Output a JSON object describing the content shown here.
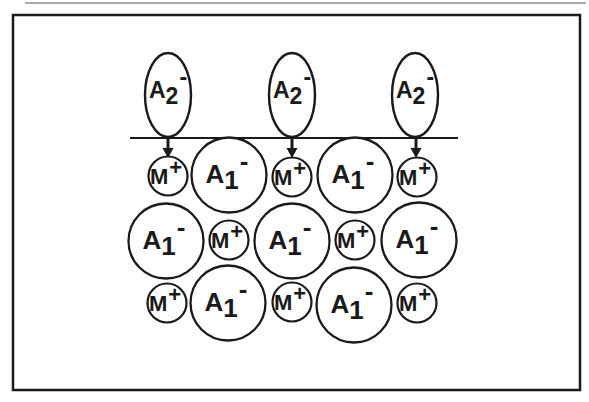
{
  "figure": {
    "canvas": {
      "width": 589,
      "height": 402
    },
    "colors": {
      "background": "#ffffff",
      "ink": "#1a1a1a",
      "faint_rule": "#a8a8a8"
    },
    "page_edge_rule": {
      "x1": 25,
      "x2": 586,
      "y": 3,
      "stroke_width": 1.8
    },
    "frame": {
      "x": 13,
      "y": 15,
      "width": 567,
      "height": 375,
      "stroke_width": 2.5
    },
    "surface_line": {
      "x1": 130,
      "x2": 458,
      "y": 138,
      "stroke_width": 2.2
    },
    "ion_labels": {
      "incoming_anion": {
        "base": "A",
        "sub": "2",
        "sup": "-"
      },
      "lattice_anion": {
        "base": "A",
        "sub": "1",
        "sup": "-"
      },
      "cation": {
        "base": "M",
        "sup": "+"
      }
    },
    "incoming_anions": {
      "rx": 23,
      "ry": 42,
      "stroke_width": 2.4,
      "positions": [
        {
          "cx": 168,
          "cy": 95
        },
        {
          "cx": 292,
          "cy": 95
        },
        {
          "cx": 415,
          "cy": 95
        }
      ]
    },
    "exchange_arrows": {
      "stem_top": 139,
      "head_top": 148,
      "tip": 158,
      "stem_width": 3,
      "half_width": 5.5,
      "xs": [
        168,
        292,
        416
      ]
    },
    "cations": {
      "r": 19.5,
      "stroke_width": 2.2,
      "positions": [
        {
          "cx": 168,
          "cy": 176
        },
        {
          "cx": 292,
          "cy": 177
        },
        {
          "cx": 417,
          "cy": 177
        },
        {
          "cx": 229,
          "cy": 240
        },
        {
          "cx": 355,
          "cy": 240
        },
        {
          "cx": 167,
          "cy": 303
        },
        {
          "cx": 292,
          "cy": 302
        },
        {
          "cx": 417,
          "cy": 303
        }
      ]
    },
    "lattice_anions": {
      "r": 37.5,
      "stroke_width": 2.3,
      "positions": [
        {
          "cx": 229,
          "cy": 175
        },
        {
          "cx": 355,
          "cy": 175
        },
        {
          "cx": 166,
          "cy": 241
        },
        {
          "cx": 292,
          "cy": 241
        },
        {
          "cx": 419,
          "cy": 240
        },
        {
          "cx": 228,
          "cy": 303
        },
        {
          "cx": 354,
          "cy": 305
        }
      ]
    }
  }
}
